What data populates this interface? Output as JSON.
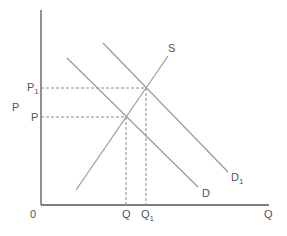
{
  "diagram": {
    "type": "supply-demand",
    "axes": {
      "origin_label": "0",
      "y_label": "P",
      "x_label": "Q"
    },
    "curves": [
      {
        "name": "S",
        "label": "S",
        "sub": ""
      },
      {
        "name": "D",
        "label": "D",
        "sub": ""
      },
      {
        "name": "D1",
        "label": "D",
        "sub": "1"
      }
    ],
    "price_levels": [
      {
        "label": "P",
        "sub": ""
      },
      {
        "label": "P",
        "sub": "1"
      }
    ],
    "quantity_levels": [
      {
        "label": "Q",
        "sub": ""
      },
      {
        "label": "Q",
        "sub": "1"
      }
    ],
    "colors": {
      "axis": "#555555",
      "curve": "#999999",
      "dash": "#888888",
      "text": "#555555"
    }
  }
}
